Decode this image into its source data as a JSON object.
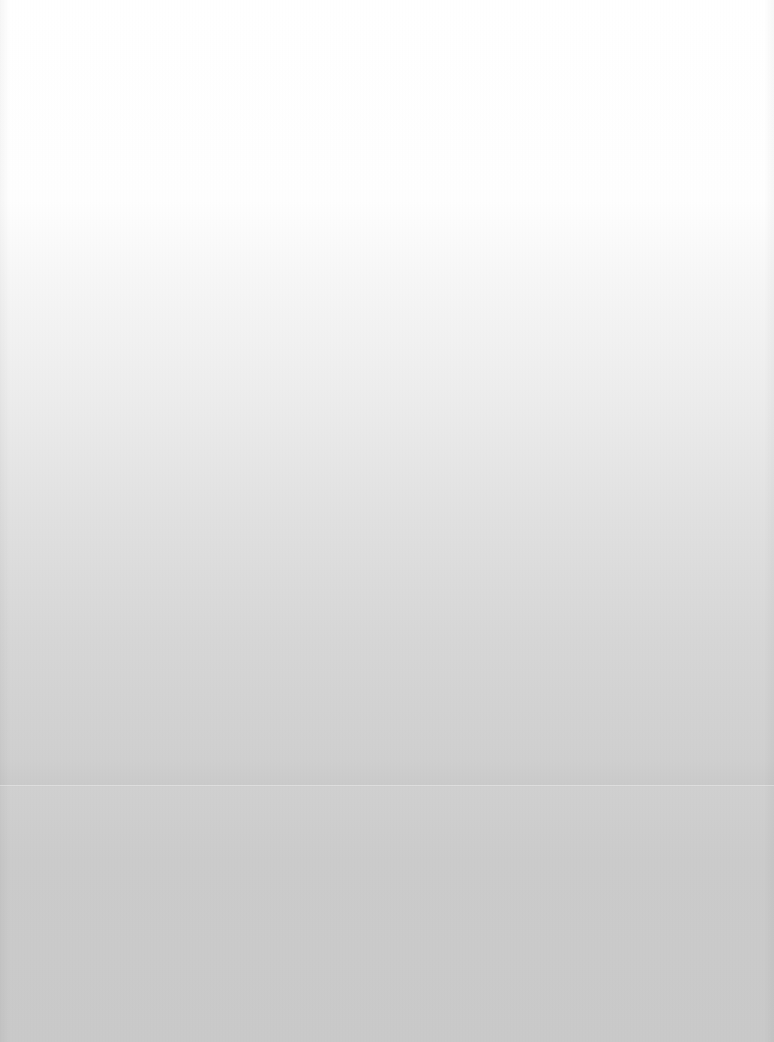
{
  "screen": {
    "state": "blank-faded",
    "background": {
      "top_color": "#ffffff",
      "bottom_color": "#c9c9c9"
    }
  }
}
